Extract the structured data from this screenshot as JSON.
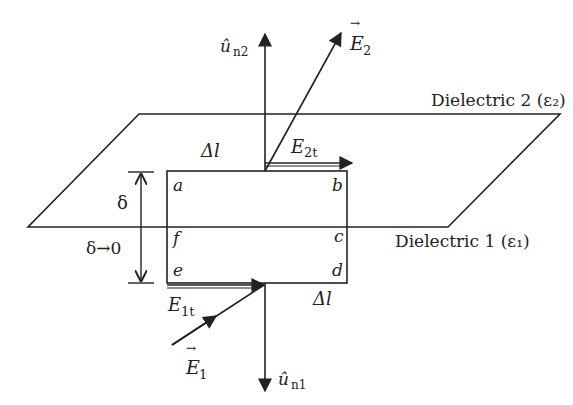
{
  "diagram": {
    "type": "boundary-condition-tangential-E",
    "dielectric_top": {
      "name": "Dielectric 2",
      "symbol": "ε",
      "subscript": "2",
      "label": "Dielectric 2 (ε₂)"
    },
    "dielectric_bottom": {
      "name": "Dielectric 1",
      "symbol": "ε",
      "subscript": "1",
      "label": "Dielectric 1 (ε₁)"
    },
    "vectors": {
      "un2": {
        "base": "û",
        "sub": "n2"
      },
      "un1": {
        "base": "û",
        "sub": "n1"
      },
      "E2": {
        "base": "E",
        "sub": "2"
      },
      "E1": {
        "base": "E",
        "sub": "1"
      },
      "E2t": {
        "base": "E",
        "sub": "2t"
      },
      "E1t": {
        "base": "E",
        "sub": "1t"
      }
    },
    "corners": {
      "a": "a",
      "b": "b",
      "c": "c",
      "d": "d",
      "e": "e",
      "f": "f"
    },
    "lengths": {
      "top": "Δl",
      "bottom": "Δl"
    },
    "height": {
      "symbol": "δ",
      "limit": "δ→0"
    },
    "colors": {
      "line": "#222222",
      "background": "#ffffff"
    }
  }
}
